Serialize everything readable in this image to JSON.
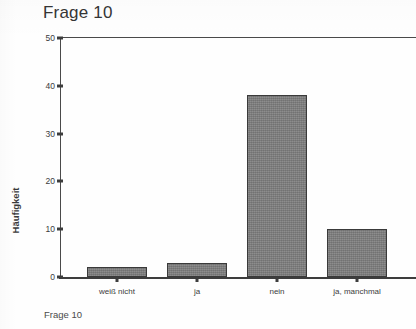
{
  "chart_data": {
    "type": "bar",
    "title": "Frage 10",
    "caption": "Frage 10",
    "xlabel": "",
    "ylabel": "Häufigkeit",
    "categories": [
      "weiß nicht",
      "ja",
      "nein",
      "ja, manchmal"
    ],
    "values": [
      2,
      3,
      38,
      10
    ],
    "ylim": [
      0,
      50
    ],
    "yticks": [
      0,
      10,
      20,
      30,
      40,
      50
    ],
    "ytick_labels": [
      "0",
      "10",
      "20",
      "30",
      "40",
      "50"
    ],
    "grid": false,
    "legend": false,
    "bar_color": "#7d7d7d",
    "bar_edge_color": "#3a3a3a",
    "axis_color": "#3d3d3d",
    "background_color": "#ffffff"
  }
}
